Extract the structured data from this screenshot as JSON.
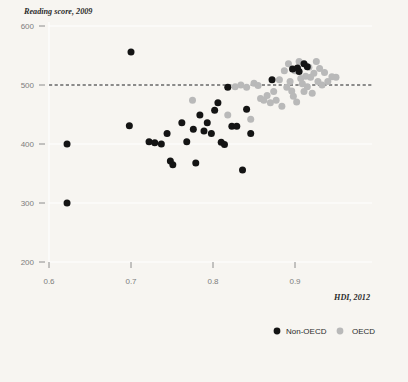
{
  "chart_data": {
    "type": "scatter",
    "title": "",
    "ylabel": "Reading score, 2009",
    "xlabel": "HDI, 2012",
    "xlim": [
      0.56,
      0.96
    ],
    "ylim": [
      200,
      600
    ],
    "x_ticks": [
      0.6,
      0.7,
      0.8,
      0.9
    ],
    "x_tick_labels": [
      "0.6",
      "0.7",
      "0.8",
      "0.9"
    ],
    "y_ticks": [
      200,
      300,
      400,
      500,
      600
    ],
    "y_tick_labels": [
      "200",
      "300",
      "400",
      "500",
      "600"
    ],
    "grid": "horizontal-white",
    "legend_position": "bottom-right",
    "reference_line": {
      "orientation": "horizontal",
      "y": 500,
      "style": "dashed",
      "color": "#1d1d1d"
    },
    "colors": {
      "non_oecd": "#141414",
      "oecd": "#b9b9b9",
      "background": "#f7f5f1",
      "gridline": "#ffffff"
    },
    "series": [
      {
        "name": "Non-OECD",
        "color": "#141414",
        "marker": "circle",
        "points": [
          [
            0.622,
            400
          ],
          [
            0.622,
            300
          ],
          [
            0.7,
            556
          ],
          [
            0.698,
            431
          ],
          [
            0.722,
            404
          ],
          [
            0.729,
            402
          ],
          [
            0.737,
            400
          ],
          [
            0.744,
            418
          ],
          [
            0.748,
            371
          ],
          [
            0.751,
            365
          ],
          [
            0.762,
            436
          ],
          [
            0.768,
            404
          ],
          [
            0.776,
            425
          ],
          [
            0.779,
            368
          ],
          [
            0.784,
            449
          ],
          [
            0.789,
            422
          ],
          [
            0.793,
            436
          ],
          [
            0.798,
            418
          ],
          [
            0.802,
            457
          ],
          [
            0.806,
            470
          ],
          [
            0.81,
            403
          ],
          [
            0.814,
            399
          ],
          [
            0.818,
            496
          ],
          [
            0.823,
            430
          ],
          [
            0.829,
            430
          ],
          [
            0.836,
            356
          ],
          [
            0.841,
            459
          ],
          [
            0.846,
            418
          ],
          [
            0.872,
            509
          ],
          [
            0.897,
            527
          ],
          [
            0.903,
            529
          ],
          [
            0.905,
            523
          ],
          [
            0.911,
            536
          ],
          [
            0.915,
            531
          ]
        ]
      },
      {
        "name": "OECD",
        "color": "#b9b9b9",
        "marker": "circle",
        "points": [
          [
            0.775,
            474
          ],
          [
            0.818,
            449
          ],
          [
            0.827,
            497
          ],
          [
            0.834,
            500
          ],
          [
            0.841,
            496
          ],
          [
            0.846,
            442
          ],
          [
            0.85,
            503
          ],
          [
            0.855,
            499
          ],
          [
            0.858,
            477
          ],
          [
            0.862,
            474
          ],
          [
            0.866,
            482
          ],
          [
            0.87,
            470
          ],
          [
            0.874,
            489
          ],
          [
            0.877,
            474
          ],
          [
            0.881,
            509
          ],
          [
            0.884,
            464
          ],
          [
            0.887,
            524
          ],
          [
            0.89,
            496
          ],
          [
            0.892,
            536
          ],
          [
            0.894,
            506
          ],
          [
            0.896,
            490
          ],
          [
            0.898,
            481
          ],
          [
            0.9,
            524
          ],
          [
            0.902,
            471
          ],
          [
            0.905,
            540
          ],
          [
            0.907,
            511
          ],
          [
            0.909,
            502
          ],
          [
            0.911,
            489
          ],
          [
            0.913,
            515
          ],
          [
            0.915,
            497
          ],
          [
            0.917,
            530
          ],
          [
            0.919,
            513
          ],
          [
            0.921,
            486
          ],
          [
            0.923,
            520
          ],
          [
            0.926,
            540
          ],
          [
            0.928,
            506
          ],
          [
            0.93,
            528
          ],
          [
            0.933,
            500
          ],
          [
            0.936,
            521
          ],
          [
            0.94,
            506
          ],
          [
            0.945,
            514
          ],
          [
            0.95,
            513
          ]
        ]
      }
    ]
  },
  "legend": {
    "items": [
      {
        "label": "Non-OECD",
        "color": "#141414"
      },
      {
        "label": "OECD",
        "color": "#b9b9b9"
      }
    ]
  }
}
